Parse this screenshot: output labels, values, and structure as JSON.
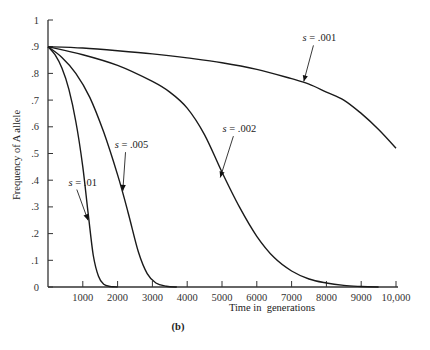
{
  "chart_data": {
    "type": "line",
    "title": "",
    "panel_label": "(b)",
    "xlabel": "Time in  generations",
    "ylabel": "Frequency of A allele",
    "xlim": [
      0,
      10000
    ],
    "ylim": [
      0,
      1
    ],
    "grid": false,
    "legend": "inline labels with arrows",
    "x_ticks": [
      1000,
      2000,
      3000,
      4000,
      5000,
      6000,
      7000,
      8000,
      9000,
      10000
    ],
    "x_tick_labels": [
      "1000",
      "2000",
      "3000",
      "4000",
      "5000",
      "6000",
      "7000",
      "8000",
      "9000",
      "10,000"
    ],
    "y_ticks": [
      0,
      0.1,
      0.2,
      0.3,
      0.4,
      0.5,
      0.6,
      0.7,
      0.8,
      0.9,
      1
    ],
    "y_tick_labels": [
      "0",
      ".1",
      ".2",
      ".3",
      ".4",
      ".5",
      ".6",
      ".7",
      ".8",
      ".9",
      "1"
    ],
    "series": [
      {
        "name": "s = .01",
        "label_prefix": "s",
        "label_value": " = .01",
        "points": [
          [
            0,
            0.9
          ],
          [
            200,
            0.87
          ],
          [
            400,
            0.82
          ],
          [
            600,
            0.74
          ],
          [
            800,
            0.62
          ],
          [
            1000,
            0.45
          ],
          [
            1150,
            0.28
          ],
          [
            1300,
            0.12
          ],
          [
            1450,
            0.04
          ],
          [
            1600,
            0.01
          ],
          [
            1800,
            0.002
          ],
          [
            2000,
            0
          ]
        ],
        "label_at": [
          1150,
          0.25
        ],
        "label_pos": [
          1000,
          0.38
        ]
      },
      {
        "name": "s = .005",
        "label_prefix": "s",
        "label_value": " = .005",
        "points": [
          [
            0,
            0.9
          ],
          [
            400,
            0.86
          ],
          [
            800,
            0.8
          ],
          [
            1200,
            0.71
          ],
          [
            1600,
            0.58
          ],
          [
            2000,
            0.42
          ],
          [
            2300,
            0.28
          ],
          [
            2600,
            0.13
          ],
          [
            2850,
            0.05
          ],
          [
            3100,
            0.015
          ],
          [
            3400,
            0.003
          ],
          [
            3700,
            0
          ]
        ],
        "label_at": [
          2150,
          0.36
        ],
        "label_pos": [
          2400,
          0.52
        ]
      },
      {
        "name": "s = .002",
        "label_prefix": "s",
        "label_value": " = .002",
        "points": [
          [
            0,
            0.9
          ],
          [
            1000,
            0.87
          ],
          [
            2000,
            0.83
          ],
          [
            3000,
            0.77
          ],
          [
            3500,
            0.73
          ],
          [
            4000,
            0.67
          ],
          [
            4500,
            0.57
          ],
          [
            5000,
            0.43
          ],
          [
            5500,
            0.3
          ],
          [
            6000,
            0.19
          ],
          [
            6500,
            0.11
          ],
          [
            7000,
            0.06
          ],
          [
            7500,
            0.03
          ],
          [
            8000,
            0.015
          ],
          [
            8500,
            0.006
          ],
          [
            9000,
            0.002
          ],
          [
            9500,
            0
          ]
        ],
        "label_at": [
          4950,
          0.41
        ],
        "label_pos": [
          5500,
          0.58
        ]
      },
      {
        "name": "s = .001",
        "label_prefix": "s",
        "label_value": " = .001",
        "points": [
          [
            0,
            0.9
          ],
          [
            1000,
            0.895
          ],
          [
            2000,
            0.885
          ],
          [
            3000,
            0.873
          ],
          [
            4000,
            0.858
          ],
          [
            5000,
            0.84
          ],
          [
            6000,
            0.815
          ],
          [
            7000,
            0.78
          ],
          [
            7500,
            0.76
          ],
          [
            8000,
            0.73
          ],
          [
            8500,
            0.7
          ],
          [
            9000,
            0.65
          ],
          [
            9500,
            0.59
          ],
          [
            10000,
            0.52
          ]
        ],
        "label_at": [
          7350,
          0.77
        ],
        "label_pos": [
          7800,
          0.92
        ]
      }
    ]
  }
}
